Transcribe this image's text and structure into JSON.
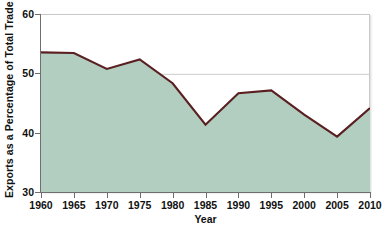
{
  "chart_data": {
    "type": "area",
    "title": "",
    "xlabel": "Year",
    "ylabel": "Exports as a Percentage of Total Trade",
    "x": [
      1960,
      1965,
      1970,
      1975,
      1980,
      1985,
      1990,
      1995,
      2000,
      2005,
      2010
    ],
    "values": [
      53.7,
      53.6,
      50.9,
      52.5,
      48.5,
      41.5,
      46.8,
      47.3,
      43.2,
      39.5,
      44.3
    ],
    "series": [
      {
        "name": "Exports as a Percentage of Total Trade",
        "values": [
          53.7,
          53.6,
          50.9,
          52.5,
          48.5,
          41.5,
          46.8,
          47.3,
          43.2,
          39.5,
          44.3
        ]
      }
    ],
    "xlim": [
      1960,
      2010
    ],
    "ylim": [
      30,
      60
    ],
    "ytick_labels": [
      "30",
      "40",
      "50",
      "60"
    ],
    "yticks": [
      30,
      40,
      50,
      60
    ],
    "xtick_labels": [
      "1960",
      "1965",
      "1970",
      "1975",
      "1980",
      "1985",
      "1990",
      "1995",
      "2000",
      "2005",
      "2010"
    ],
    "grid": true,
    "gridlines_y": [
      50
    ],
    "legend": false,
    "legend_position": "none",
    "colors": {
      "area_fill": "#b2cec1",
      "line": "#5a1f20",
      "axis": "#6e6e6e",
      "gridline": "#cccccc",
      "plot_border": "#c9c9c9",
      "background": "#ffffff",
      "text": "#111111"
    }
  },
  "axes": {
    "y_title": "Exports as a Percentage of Total Trade",
    "x_title": "Year"
  }
}
